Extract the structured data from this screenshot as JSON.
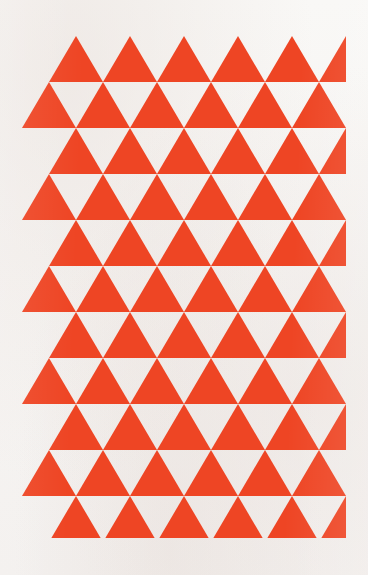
{
  "artwork": {
    "title": "Red Triangle Tessellation",
    "medium": "geometric pattern",
    "colors": {
      "triangle_fill": "#ee4524",
      "background": "#fbfaf9",
      "paper_tint": "#f7f5f4"
    },
    "canvas": {
      "width": 368,
      "height": 575
    },
    "pattern": {
      "type": "triangular-tessellation",
      "orientation": "upward-pointing",
      "grid_origin_x": 22,
      "grid_origin_y": 36,
      "grid_width": 324,
      "grid_height": 502,
      "triangle_base": 54,
      "triangle_height": 46,
      "row_count": 11,
      "row_offset_alternating": true,
      "offset_row_triangle_count": 6,
      "flush_row_triangle_count": 7,
      "rows": [
        {
          "index": 0,
          "style": "offset",
          "offset_x": 27,
          "count": 6,
          "y": 36
        },
        {
          "index": 1,
          "style": "flush",
          "offset_x": 0,
          "count": 7,
          "y": 82
        },
        {
          "index": 2,
          "style": "offset",
          "offset_x": 27,
          "count": 6,
          "y": 128
        },
        {
          "index": 3,
          "style": "flush",
          "offset_x": 0,
          "count": 7,
          "y": 174
        },
        {
          "index": 4,
          "style": "offset",
          "offset_x": 27,
          "count": 6,
          "y": 220
        },
        {
          "index": 5,
          "style": "flush",
          "offset_x": 0,
          "count": 7,
          "y": 266
        },
        {
          "index": 6,
          "style": "offset",
          "offset_x": 27,
          "count": 6,
          "y": 312
        },
        {
          "index": 7,
          "style": "flush",
          "offset_x": 0,
          "count": 7,
          "y": 358
        },
        {
          "index": 8,
          "style": "offset",
          "offset_x": 27,
          "count": 6,
          "y": 404
        },
        {
          "index": 9,
          "style": "flush",
          "offset_x": 0,
          "count": 7,
          "y": 450
        },
        {
          "index": 10,
          "style": "offset",
          "offset_x": 27,
          "count": 6,
          "y": 496
        }
      ]
    }
  }
}
